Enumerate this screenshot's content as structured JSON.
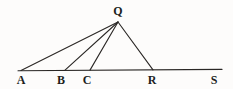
{
  "figure": {
    "kind": "geometry-diagram",
    "background_color": "#fdfcfb",
    "stroke_color": "#2a2725",
    "label_color": "#201e1d",
    "stroke_width": 1.1,
    "canvas": {
      "width": 233,
      "height": 89
    }
  },
  "chart_data": {
    "type": "scatter",
    "title": "",
    "xlabel": "",
    "ylabel": "",
    "grid": false,
    "legend": null,
    "xlim": [
      0,
      233
    ],
    "ylim": [
      0,
      89
    ],
    "points": [
      {
        "name": "Q",
        "x": 118,
        "y": 22,
        "label": "Q",
        "label_x": 118,
        "label_y": 11
      },
      {
        "name": "A",
        "x": 21,
        "y": 70,
        "label": "A",
        "label_x": 21,
        "label_y": 80
      },
      {
        "name": "B",
        "x": 65,
        "y": 70,
        "label": "B",
        "label_x": 61,
        "label_y": 80
      },
      {
        "name": "C",
        "x": 90,
        "y": 70,
        "label": "C",
        "label_x": 87,
        "label_y": 80
      },
      {
        "name": "R",
        "x": 153,
        "y": 70,
        "label": "R",
        "label_x": 152,
        "label_y": 80
      },
      {
        "name": "S",
        "x": 218,
        "y": 70,
        "label": "S",
        "label_x": 214,
        "label_y": 80
      }
    ],
    "segments": [
      {
        "name": "baseline-A-to-S",
        "from": "A",
        "to": "S",
        "x1": 18,
        "y1": 70.8,
        "x2": 222,
        "y2": 69.4
      },
      {
        "name": "cevian-Q-to-A",
        "from": "Q",
        "to": "A",
        "x1": 118,
        "y1": 22,
        "x2": 21,
        "y2": 70.4
      },
      {
        "name": "cevian-Q-to-B",
        "from": "Q",
        "to": "B",
        "x1": 118,
        "y1": 22,
        "x2": 65,
        "y2": 70.2
      },
      {
        "name": "cevian-Q-to-C",
        "from": "Q",
        "to": "C",
        "x1": 118,
        "y1": 22,
        "x2": 90,
        "y2": 70.1
      },
      {
        "name": "side-Q-to-R",
        "from": "Q",
        "to": "R",
        "x1": 118,
        "y1": 22,
        "x2": 153,
        "y2": 69.9
      }
    ],
    "labels": [
      "Q",
      "A",
      "B",
      "C",
      "R",
      "S"
    ]
  }
}
